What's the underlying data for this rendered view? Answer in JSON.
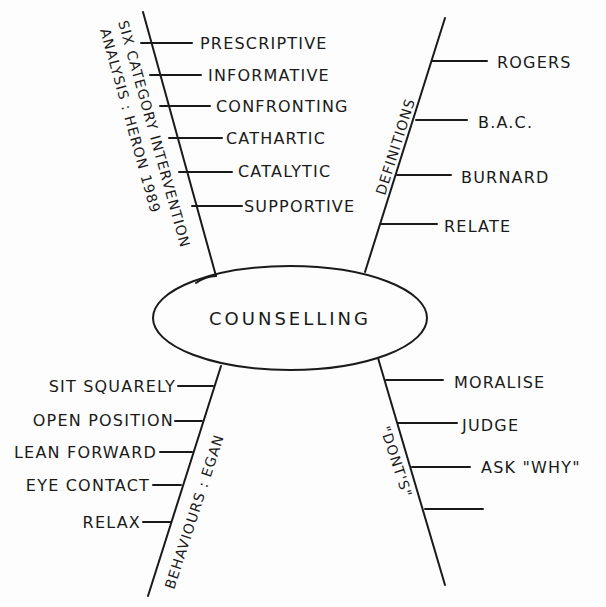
{
  "colors": {
    "ink": "#1a1a1a",
    "paper": "#fdfdfd"
  },
  "center": {
    "label": "COUNSELLING"
  },
  "branches": {
    "heron": {
      "title_line1": "SIX CATEGORY INTERVENTION",
      "title_line2": "ANALYSIS : HERON 1989",
      "items": [
        "PRESCRIPTIVE",
        "INFORMATIVE",
        "CONFRONTING",
        "CATHARTIC",
        "CATALYTIC",
        "SUPPORTIVE"
      ]
    },
    "definitions": {
      "title": "DEFINITIONS",
      "items": [
        "ROGERS",
        "B.A.C.",
        "BURNARD",
        "RELATE"
      ]
    },
    "egan": {
      "title": "BEHAVIOURS : EGAN",
      "items": [
        "SIT SQUARELY",
        "OPEN POSITION",
        "LEAN FORWARD",
        "EYE CONTACT",
        "RELAX"
      ]
    },
    "donts": {
      "title": "\"DONT'S\"",
      "items": [
        "MORALISE",
        "JUDGE",
        "ASK \"WHY\"",
        ""
      ]
    }
  }
}
